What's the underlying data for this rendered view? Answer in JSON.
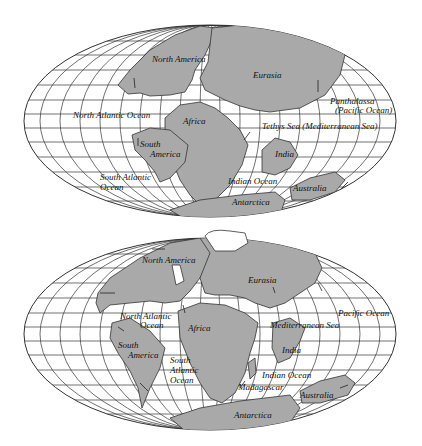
{
  "maps": [
    {
      "name": "pangaea-breakup-early",
      "labels": {
        "north_america": "North America",
        "eurasia": "Eurasia",
        "north_atlantic": "North Atlantic Ocean",
        "africa": "Africa",
        "panthalassa": "Panthalassa",
        "pacific": "(Pacific Ocean)",
        "tethys": "Tethys Sea (Mediterranean Sea)",
        "south_america_1": "South",
        "south_america_2": "America",
        "india": "India",
        "south_atlantic_1": "South Atlantic",
        "south_atlantic_2": "Ocean",
        "indian_ocean": "Indian Ocean",
        "australia": "Australia",
        "antarctica": "Antarctica"
      }
    },
    {
      "name": "continents-later",
      "labels": {
        "north_america": "North America",
        "eurasia": "Eurasia",
        "north_atlantic_1": "North Atlantic",
        "north_atlantic_2": "Ocean",
        "africa": "Africa",
        "pacific": "Pacific Ocean",
        "mediterranean": "Mediterranean Sea",
        "south_america_1": "South",
        "south_america_2": "America",
        "south_atlantic_1": "South",
        "south_atlantic_2": "Atlantic",
        "south_atlantic_3": "Ocean",
        "india": "India",
        "indian_ocean": "Indian Ocean",
        "madagascar": "Madagascar",
        "australia": "Australia",
        "antarctica": "Antarctica"
      }
    }
  ],
  "colors": {
    "land": "#a9a9a9",
    "ocean": "#ffffff",
    "lines": "#333333"
  }
}
